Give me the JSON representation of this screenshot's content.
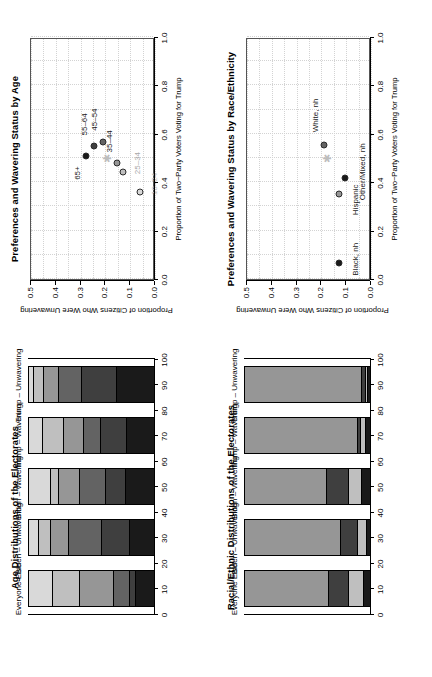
{
  "figure": {
    "rotation_note": "rotated-90",
    "colors": {
      "grey_lightest": "#d9d9d9",
      "grey_light": "#bfbfbf",
      "grey_mid": "#969696",
      "grey_dark": "#636363",
      "grey_darker": "#3f3f3f",
      "grey_darkest": "#1a1a1a",
      "star": "#bdbdbd",
      "gridline": "#d3d3d3",
      "axis": "#000000"
    }
  },
  "panels": {
    "age_bars": {
      "title": "Age Distributions of the Electorates",
      "axis_label": "",
      "axis_ticks": [
        "0",
        "10",
        "20",
        "30",
        "40",
        "50",
        "60",
        "70",
        "80",
        "90",
        "100"
      ],
      "categories": [
        "Everyone Else",
        "Biden – Unwavering",
        "Biden – Wavering",
        "Trump – Wavering",
        "Trump – Unwavering"
      ]
    },
    "age_scatter": {
      "title": "Preferences and Wavering Status by Age",
      "xlabel": "Proportion of Two−Party Voters Voting for Trump",
      "ylabel": "Proportion of Citizens Who Were Unwavering",
      "xticks": [
        "0.0",
        "0.2",
        "0.4",
        "0.6",
        "0.8",
        "1.0"
      ],
      "yticks": [
        "0.0",
        "0.1",
        "0.2",
        "0.3",
        "0.4",
        "0.5"
      ]
    },
    "race_bars": {
      "title": "Racial/Ethnic Distributions of the Electorates",
      "axis_label": "",
      "axis_ticks": [
        "0",
        "10",
        "20",
        "30",
        "40",
        "50",
        "60",
        "70",
        "80",
        "90",
        "100"
      ],
      "categories": [
        "Everyone Else",
        "Biden – Unwavering",
        "Biden – Wavering",
        "Trump – Wavering",
        "Trump – Unwavering"
      ]
    },
    "race_scatter": {
      "title": "Preferences and Wavering Status by Race/Ethnicity",
      "xlabel": "Proportion of Two−Party Voters Voting for Trump",
      "ylabel": "Proportion of Citizens Who Were Unwavering",
      "xticks": [
        "0.0",
        "0.2",
        "0.4",
        "0.6",
        "0.8",
        "1.0"
      ],
      "yticks": [
        "0.0",
        "0.1",
        "0.2",
        "0.3",
        "0.4",
        "0.5"
      ]
    }
  },
  "chart_data": [
    {
      "id": "age_bars",
      "type": "bar",
      "orientation": "horizontal-stacked",
      "title": "Age Distributions of the Electorates",
      "xlabel": "",
      "ylabel": "",
      "xlim": [
        0,
        100
      ],
      "grid": true,
      "categories": [
        "Everyone Else",
        "Biden – Unwavering",
        "Biden – Wavering",
        "Trump – Wavering",
        "Trump – Unwavering"
      ],
      "stack_order": [
        "18–24",
        "25–34",
        "35–44",
        "45–54",
        "55–64",
        "65+"
      ],
      "stack_colors": [
        "#d9d9d9",
        "#bfbfbf",
        "#969696",
        "#636363",
        "#3f3f3f",
        "#1a1a1a"
      ],
      "series": [
        {
          "name": "18–24",
          "values": [
            18,
            7,
            17,
            10,
            3
          ]
        },
        {
          "name": "25–34",
          "values": [
            22,
            10,
            6,
            17,
            8
          ]
        },
        {
          "name": "35–44",
          "values": [
            27,
            14,
            17,
            16,
            12
          ]
        },
        {
          "name": "45–54",
          "values": [
            12,
            26,
            20,
            13,
            18
          ]
        },
        {
          "name": "55–64",
          "values": [
            5,
            22,
            16,
            21,
            28
          ]
        },
        {
          "name": "65+",
          "values": [
            16,
            21,
            24,
            23,
            31
          ]
        }
      ]
    },
    {
      "id": "age_scatter",
      "type": "scatter",
      "title": "Preferences and Wavering Status by Age",
      "xlabel": "Proportion of Two−Party Voters Voting for Trump",
      "ylabel": "Proportion of Citizens Who Were Unwavering",
      "xlim": [
        0.0,
        1.0
      ],
      "ylim": [
        0.0,
        0.5
      ],
      "grid": true,
      "points": [
        {
          "label": "18–24",
          "x": 0.36,
          "y": 0.062,
          "color": "#d9d9d9",
          "label_dx": 8,
          "label_dy": 14
        },
        {
          "label": "25–34",
          "x": 0.442,
          "y": 0.128,
          "color": "#bfbfbf",
          "label_dx": 9,
          "label_dy": 14
        },
        {
          "label": "35–44",
          "x": 0.478,
          "y": 0.152,
          "color": "#969696",
          "label_dx": 22,
          "label_dy": -8
        },
        {
          "label": "45–54",
          "x": 0.568,
          "y": 0.208,
          "color": "#636363",
          "label_dx": 22,
          "label_dy": -9
        },
        {
          "label": "55–64",
          "x": 0.548,
          "y": 0.247,
          "color": "#3f3f3f",
          "label_dx": 22,
          "label_dy": -10
        },
        {
          "label": "65+",
          "x": 0.508,
          "y": 0.277,
          "color": "#1a1a1a",
          "label_dx": -17,
          "label_dy": -9
        }
      ],
      "reference_marker": {
        "symbol": "asterisk",
        "x": 0.5,
        "y": 0.193,
        "color": "#bdbdbd"
      }
    },
    {
      "id": "race_bars",
      "type": "bar",
      "orientation": "horizontal-stacked",
      "title": "Racial/Ethnic Distributions of the Electorates",
      "xlabel": "",
      "ylabel": "",
      "xlim": [
        0,
        100
      ],
      "grid": true,
      "categories": [
        "Everyone Else",
        "Biden – Unwavering",
        "Biden – Wavering",
        "Trump – Wavering",
        "Trump – Unwavering"
      ],
      "stack_order": [
        "White, nh",
        "Black, nh",
        "Hispanic",
        "Other/Mixed, nh"
      ],
      "stack_colors": [
        "#969696",
        "#3f3f3f",
        "#bfbfbf",
        "#1a1a1a"
      ],
      "series": [
        {
          "name": "White, nh",
          "values": [
            66,
            75,
            64,
            89,
            92
          ]
        },
        {
          "name": "Black, nh",
          "values": [
            16,
            14,
            18,
            2,
            3
          ]
        },
        {
          "name": "Hispanic",
          "values": [
            12,
            7,
            10,
            4,
            2
          ]
        },
        {
          "name": "Other/Mixed, nh",
          "values": [
            6,
            4,
            8,
            5,
            3
          ]
        }
      ]
    },
    {
      "id": "race_scatter",
      "type": "scatter",
      "title": "Preferences and Wavering Status by Race/Ethnicity",
      "xlabel": "Proportion of Two−Party Voters Voting for Trump",
      "ylabel": "Proportion of Citizens Who Were Unwavering",
      "xlim": [
        0.0,
        1.0
      ],
      "ylim": [
        0.0,
        0.5
      ],
      "grid": true,
      "points": [
        {
          "label": "Black, nh",
          "x": 0.065,
          "y": 0.128,
          "color": "#1a1a1a",
          "label_dx": 4,
          "label_dy": 16
        },
        {
          "label": "Hispanic",
          "x": 0.352,
          "y": 0.128,
          "color": "#969696",
          "label_dx": -6,
          "label_dy": 16
        },
        {
          "label": "Other/Mixed, nh",
          "x": 0.418,
          "y": 0.105,
          "color": "#1a1a1a",
          "label_dx": 6,
          "label_dy": 17
        },
        {
          "label": "White, nh",
          "x": 0.552,
          "y": 0.188,
          "color": "#636363",
          "label_dx": 30,
          "label_dy": -9
        }
      ],
      "reference_marker": {
        "symbol": "asterisk",
        "x": 0.5,
        "y": 0.178,
        "color": "#bdbdbd"
      }
    }
  ]
}
